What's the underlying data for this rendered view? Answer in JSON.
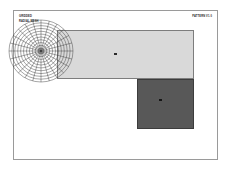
{
  "header": {
    "title": "GRIDDED",
    "subtitle": "RADIAL MESH",
    "right_label": "PATTERN  V1.0"
  },
  "viewport": {
    "frame_label": "plot-frame",
    "background_color": "#ffffff",
    "border_color": "#9a9a9a"
  },
  "chart_data": {
    "type": "scatter",
    "title": "GRIDDED",
    "subtitle": "RADIAL MESH",
    "xlabel": "",
    "ylabel": "",
    "grid": true,
    "legend": "none",
    "regions": [
      {
        "name": "main-field",
        "shape": "rectangle",
        "fill": "#d9d9d9",
        "stroke": "#7d7d7d",
        "x": 57,
        "y": 30,
        "width": 137,
        "height": 49
      },
      {
        "name": "dark-field",
        "shape": "rectangle",
        "fill": "#585858",
        "stroke": "#3c3c3c",
        "x": 137,
        "y": 79,
        "width": 57,
        "height": 50
      }
    ],
    "polar_mesh": {
      "name": "radial-grid",
      "center_x": 41,
      "center_y": 51,
      "outer_radius": 33,
      "ring_count": 11,
      "spoke_count": 24,
      "stroke": "#3a3a3a"
    },
    "markers": [
      {
        "name": "main-marker",
        "x": 114,
        "y": 53,
        "color": "#2a2a2a"
      },
      {
        "name": "dark-marker",
        "x": 159,
        "y": 99,
        "color": "#151515"
      }
    ]
  }
}
